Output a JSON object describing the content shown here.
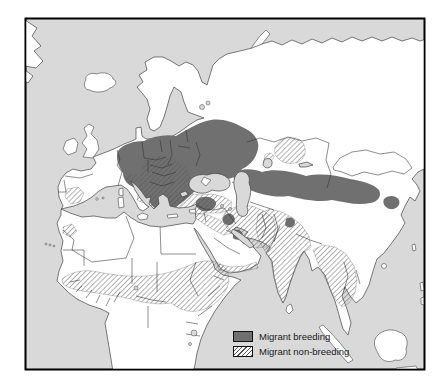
{
  "figure": {
    "type": "species distribution map",
    "legend": {
      "items": [
        {
          "id": "breeding",
          "label": "Migrant breeding",
          "swatch": "solid"
        },
        {
          "id": "non_breeding",
          "label": "Migrant non-breeding",
          "swatch": "hatched"
        }
      ]
    }
  },
  "colors": {
    "sea": "#d9d9d9",
    "land": "#ffffff",
    "breeding": "#707070",
    "hatch_line": "#555555",
    "coast": "#444444",
    "border": "#303030",
    "frame": "#000000",
    "text": "#1a1a1a",
    "page_bg": "#ffffff"
  }
}
